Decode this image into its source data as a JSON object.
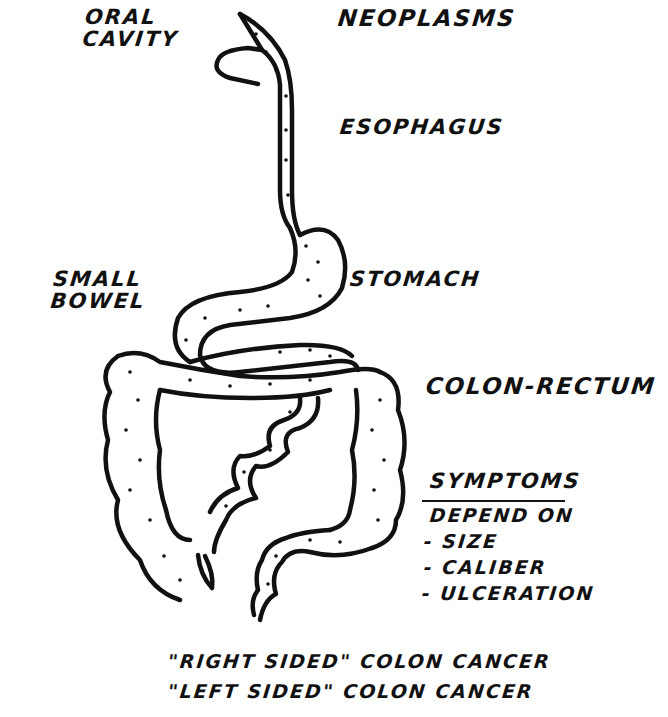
{
  "title": "Neoplasms",
  "labels": {
    "oral_cavity": [
      "Oral",
      "Cavity"
    ],
    "neoplasms": "Neoplasms",
    "esophagus": "Esophagus",
    "small_bowel": [
      "Small",
      "Bowel"
    ],
    "stomach": "Stomach",
    "colon_rectum": "Colon-Rectum"
  },
  "symptoms": {
    "heading": "Symptoms",
    "subheading": "Depend on",
    "items": [
      "- Size",
      "- Caliber",
      "- Ulceration"
    ]
  },
  "footer": {
    "line1": "\"Right sided\" colon cancer",
    "line2": "\"Left sided\" colon cancer"
  },
  "colors": {
    "ink": "#111111",
    "paper": "#ffffff"
  }
}
